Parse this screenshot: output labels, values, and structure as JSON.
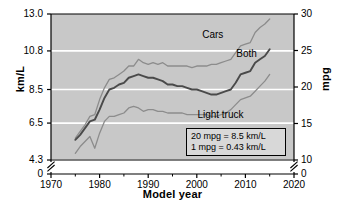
{
  "chart_data": {
    "type": "line",
    "title": "",
    "xlabel": "Model year",
    "ylabel": "km/L",
    "ylabel_right": "mpg",
    "xlim": [
      1970,
      2020
    ],
    "ylim": [
      4.3,
      13.0
    ],
    "ylim_right": [
      10,
      30
    ],
    "grid": true,
    "legend_position": "inline-labels",
    "axis_break": true,
    "x_ticks": [
      "1970",
      "1980",
      "1990",
      "2000",
      "2010",
      "2020"
    ],
    "x_tick_values": [
      1970,
      1980,
      1990,
      2000,
      2010,
      2020
    ],
    "x_minor_tick_values": [
      1975,
      1985,
      1995,
      2005,
      2015
    ],
    "y_ticks_left": [
      "13.0",
      "10.8",
      "8.5",
      "6.5",
      "4.3",
      "0"
    ],
    "y_tick_values_left": [
      13.0,
      10.8,
      8.5,
      6.5,
      4.3,
      0
    ],
    "y_ticks_right": [
      "30",
      "25",
      "20",
      "15",
      "10",
      "0"
    ],
    "y_tick_values_right": [
      30,
      25,
      20,
      15,
      10,
      0
    ],
    "gridline_values_left": [
      10.8,
      8.5,
      6.5,
      4.3
    ],
    "series": [
      {
        "name": "Cars",
        "color": "#8c8c8c",
        "label_x": 2004,
        "label_y": 11.7,
        "x": [
          1975,
          1976,
          1977,
          1978,
          1979,
          1980,
          1981,
          1982,
          1983,
          1984,
          1985,
          1986,
          1987,
          1988,
          1989,
          1990,
          1991,
          1992,
          1993,
          1994,
          1995,
          1996,
          1997,
          1998,
          1999,
          2000,
          2001,
          2002,
          2003,
          2004,
          2005,
          2006,
          2007,
          2008,
          2009,
          2010,
          2011,
          2012,
          2013,
          2014,
          2015
        ],
        "values": [
          5.6,
          6.0,
          6.4,
          6.9,
          7.0,
          7.9,
          8.6,
          9.1,
          9.2,
          9.4,
          9.6,
          9.9,
          9.9,
          10.3,
          10.1,
          10.0,
          10.1,
          10.0,
          10.1,
          9.9,
          9.9,
          9.9,
          9.9,
          9.9,
          9.8,
          9.9,
          9.9,
          9.9,
          10.0,
          10.0,
          10.1,
          10.2,
          10.3,
          10.7,
          11.1,
          11.2,
          11.3,
          11.9,
          12.2,
          12.4,
          12.7
        ]
      },
      {
        "name": "Both",
        "color": "#4a4a4a",
        "label_x": 2011,
        "label_y": 10.55,
        "x": [
          1975,
          1976,
          1977,
          1978,
          1979,
          1980,
          1981,
          1982,
          1983,
          1984,
          1985,
          1986,
          1987,
          1988,
          1989,
          1990,
          1991,
          1992,
          1993,
          1994,
          1995,
          1996,
          1997,
          1998,
          1999,
          2000,
          2001,
          2002,
          2003,
          2004,
          2005,
          2006,
          2007,
          2008,
          2009,
          2010,
          2011,
          2012,
          2013,
          2014,
          2015
        ],
        "values": [
          5.5,
          5.8,
          6.2,
          6.6,
          6.7,
          7.3,
          8.0,
          8.5,
          8.6,
          8.8,
          8.9,
          9.2,
          9.3,
          9.4,
          9.3,
          9.2,
          9.2,
          9.1,
          9.0,
          8.8,
          8.8,
          8.7,
          8.7,
          8.6,
          8.5,
          8.5,
          8.4,
          8.3,
          8.2,
          8.2,
          8.3,
          8.4,
          8.5,
          8.9,
          9.4,
          9.5,
          9.6,
          10.1,
          10.3,
          10.5,
          10.9
        ]
      },
      {
        "name": "Light truck",
        "color": "#8c8c8c",
        "label_x": 2003,
        "label_y": 6.95,
        "x": [
          1975,
          1976,
          1977,
          1978,
          1979,
          1980,
          1981,
          1982,
          1983,
          1984,
          1985,
          1986,
          1987,
          1988,
          1989,
          1990,
          1991,
          1992,
          1993,
          1994,
          1995,
          1996,
          1997,
          1998,
          1999,
          2000,
          2001,
          2002,
          2003,
          2004,
          2005,
          2006,
          2007,
          2008,
          2009,
          2010,
          2011,
          2012,
          2013,
          2014,
          2015
        ],
        "values": [
          4.7,
          5.1,
          5.4,
          5.7,
          5.0,
          5.9,
          6.6,
          6.9,
          6.9,
          7.0,
          7.1,
          7.4,
          7.5,
          7.4,
          7.2,
          7.3,
          7.3,
          7.2,
          7.2,
          7.1,
          7.1,
          7.1,
          7.1,
          7.0,
          7.0,
          7.0,
          7.0,
          7.0,
          6.9,
          6.9,
          7.0,
          7.1,
          7.3,
          7.6,
          7.9,
          8.0,
          8.1,
          8.4,
          8.7,
          9.0,
          9.4
        ]
      }
    ],
    "annotations": [
      "20 mpg = 8.5 km/L",
      "1 mpg = 0.43 km/L"
    ],
    "colors": {
      "plot_background": "#c8c8c8",
      "gridline": "#ffffff",
      "axis": "#000000",
      "note_background": "#d8d8d8"
    }
  }
}
